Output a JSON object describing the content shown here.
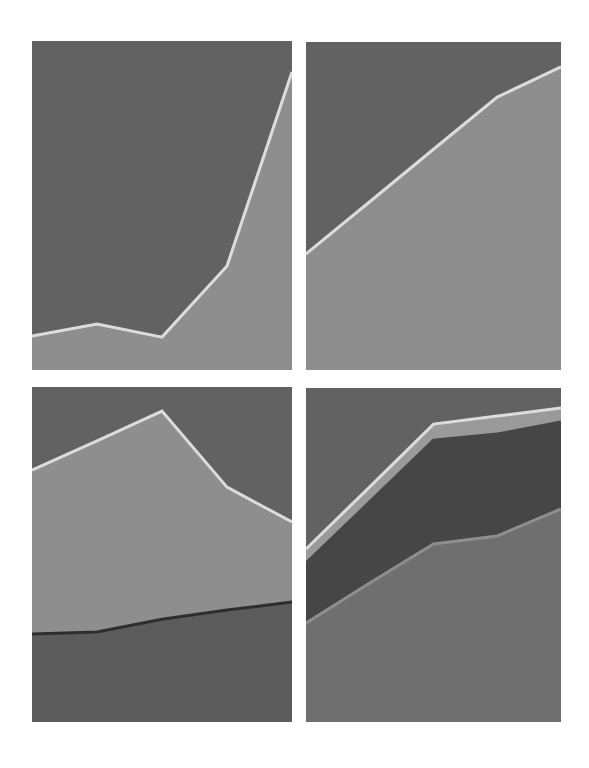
{
  "colors": {
    "background": "#626262",
    "light_fill": "#8e8e8e",
    "line_light": "#dcdcdc",
    "dark_band": "#464646",
    "mid_fill": "#6f6f6f",
    "dark_line": "#2e2e2e",
    "panel3_bottom": "#5c5c5c",
    "band_light": "#9a9a9a"
  },
  "chart_data": [
    {
      "type": "area",
      "title": "",
      "xlabel": "",
      "ylabel": "",
      "x": [
        0,
        1,
        2,
        3,
        4
      ],
      "ylim": [
        0,
        100
      ],
      "grid": false,
      "legend": "none",
      "series": [
        {
          "name": "series_1",
          "values": [
            10.3,
            14.0,
            10.0,
            31.6,
            90.6
          ],
          "fill": "#8e8e8e",
          "line": "#dcdcdc"
        }
      ]
    },
    {
      "type": "area",
      "title": "",
      "xlabel": "",
      "ylabel": "",
      "x": [
        0,
        1,
        2,
        3,
        4
      ],
      "ylim": [
        0,
        100
      ],
      "grid": false,
      "legend": "none",
      "series": [
        {
          "name": "series_1",
          "values": [
            35.4,
            51.3,
            67.3,
            83.2,
            92.4
          ],
          "fill": "#8e8e8e",
          "line": "#dcdcdc"
        }
      ]
    },
    {
      "type": "area",
      "stacked": true,
      "title": "",
      "xlabel": "",
      "ylabel": "",
      "x": [
        0,
        1,
        2,
        3,
        4
      ],
      "ylim": [
        0,
        100
      ],
      "grid": false,
      "legend": "none",
      "series": [
        {
          "name": "series_1",
          "values": [
            26.3,
            26.9,
            30.7,
            33.4,
            35.8
          ],
          "fill": "#5c5c5c",
          "line": "#2e2e2e"
        },
        {
          "name": "series_2",
          "values": [
            48.9,
            57.0,
            62.1,
            36.7,
            23.9
          ],
          "fill": "#8e8e8e",
          "line": "#dcdcdc"
        }
      ]
    },
    {
      "type": "area",
      "stacked": true,
      "title": "",
      "xlabel": "",
      "ylabel": "",
      "x": [
        0,
        1,
        2,
        3,
        4
      ],
      "ylim": [
        0,
        100
      ],
      "grid": false,
      "legend": "none",
      "series": [
        {
          "name": "series_1",
          "values": [
            29.6,
            41.6,
            53.3,
            55.7,
            63.8
          ],
          "fill": "#6f6f6f",
          "line": "#8e8e8e"
        },
        {
          "name": "series_2",
          "values": [
            18.0,
            24.3,
            31.1,
            30.5,
            26.0
          ],
          "fill": "#464646",
          "line": "#464646"
        },
        {
          "name": "series_3",
          "values": [
            4.2,
            4.5,
            4.8,
            5.4,
            4.2
          ],
          "fill": "#9a9a9a",
          "line": "#dcdcdc"
        }
      ]
    }
  ],
  "panels": [
    {
      "left": 32,
      "top": 41,
      "width": 260,
      "height": 329
    },
    {
      "left": 306,
      "top": 42,
      "width": 255,
      "height": 328
    },
    {
      "left": 32,
      "top": 387,
      "width": 260,
      "height": 335
    },
    {
      "left": 306,
      "top": 388,
      "width": 255,
      "height": 334
    }
  ]
}
